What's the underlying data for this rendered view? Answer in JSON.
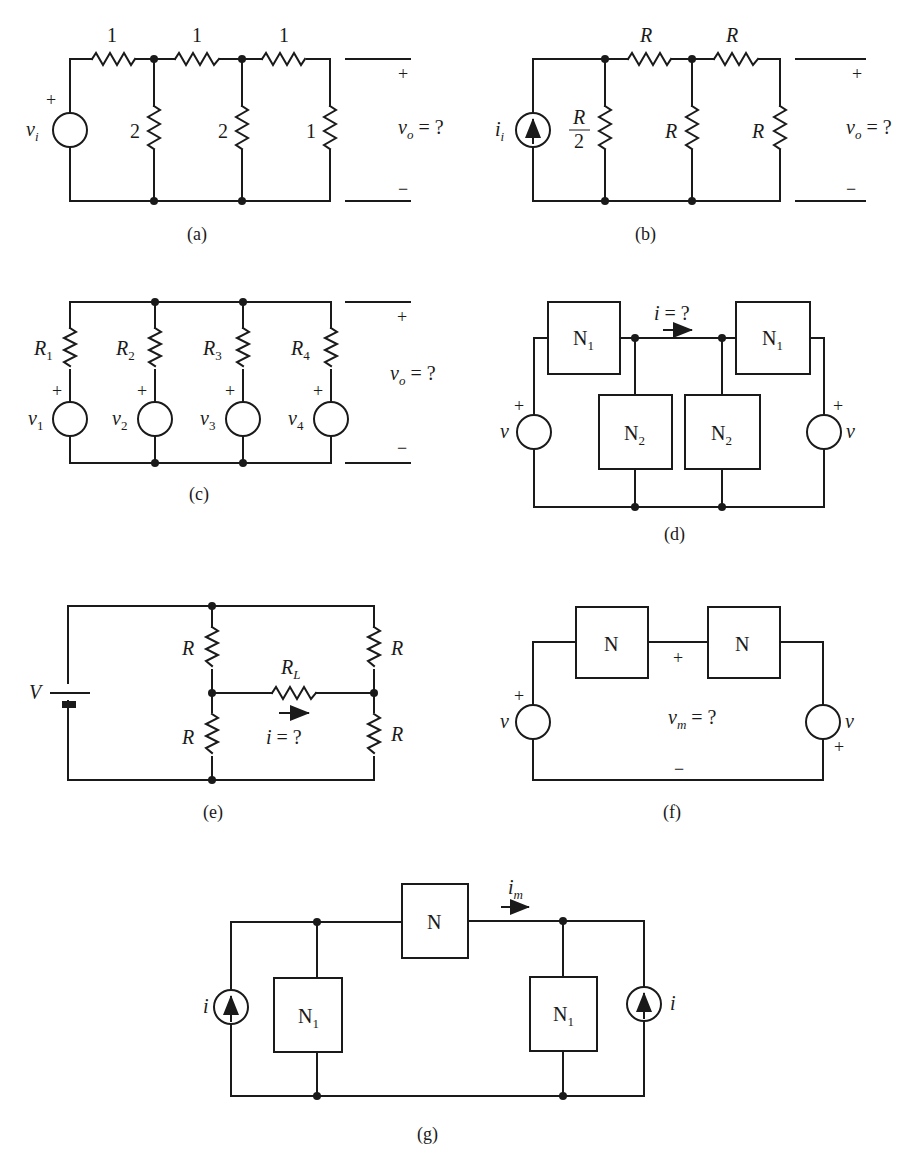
{
  "figure": {
    "panels": [
      {
        "id": "a",
        "caption": "(a)",
        "series_resistors": [
          "1",
          "1",
          "1"
        ],
        "shunt_resistors": [
          "2",
          "2",
          "1"
        ],
        "source": {
          "type": "voltage",
          "label": "v",
          "sub": "i",
          "polarity": "+"
        },
        "output": {
          "label": "v",
          "sub": "o",
          "expr": " = ?",
          "plus": "+",
          "minus": "−"
        }
      },
      {
        "id": "b",
        "caption": "(b)",
        "series_resistors": [
          "R",
          "R"
        ],
        "shunt_resistors": [
          {
            "label": "R",
            "denominator": "2"
          },
          {
            "label": "R"
          },
          {
            "label": "R"
          }
        ],
        "source": {
          "type": "current",
          "label": "i",
          "sub": "i"
        },
        "output": {
          "label": "v",
          "sub": "o",
          "expr": " = ?",
          "plus": "+",
          "minus": "−"
        }
      },
      {
        "id": "c",
        "caption": "(c)",
        "branches": [
          {
            "resistor": "R",
            "resistor_sub": "1",
            "source": "v",
            "source_sub": "1",
            "polarity": "+"
          },
          {
            "resistor": "R",
            "resistor_sub": "2",
            "source": "v",
            "source_sub": "2",
            "polarity": "+"
          },
          {
            "resistor": "R",
            "resistor_sub": "3",
            "source": "v",
            "source_sub": "3",
            "polarity": "+"
          },
          {
            "resistor": "R",
            "resistor_sub": "4",
            "source": "v",
            "source_sub": "4",
            "polarity": "+"
          }
        ],
        "output": {
          "label": "v",
          "sub": "o",
          "expr": " = ?",
          "plus": "+",
          "minus": "−"
        }
      },
      {
        "id": "d",
        "caption": "(d)",
        "blocks": [
          {
            "label": "N",
            "sub": "1"
          },
          {
            "label": "N",
            "sub": "1"
          },
          {
            "label": "N",
            "sub": "2"
          },
          {
            "label": "N",
            "sub": "2"
          }
        ],
        "sources": [
          {
            "label": "v",
            "polarity": "+"
          },
          {
            "label": "v",
            "polarity": "+"
          }
        ],
        "unknown": {
          "label": "i",
          "expr": " = ?"
        }
      },
      {
        "id": "e",
        "caption": "(e)",
        "battery": "V",
        "resistors": [
          "R",
          "R",
          "R",
          "R"
        ],
        "load": {
          "label": "R",
          "sub": "L"
        },
        "unknown": {
          "label": "i",
          "expr": " = ?"
        }
      },
      {
        "id": "f",
        "caption": "(f)",
        "blocks": [
          {
            "label": "N"
          },
          {
            "label": "N"
          }
        ],
        "sources": [
          {
            "label": "v",
            "polarity": "+"
          },
          {
            "label": "v",
            "polarity": "+"
          }
        ],
        "unknown": {
          "label": "v",
          "sub": "m",
          "expr": " = ?",
          "plus": "+",
          "minus": "−"
        }
      },
      {
        "id": "g",
        "caption": "(g)",
        "blocks": [
          {
            "label": "N"
          },
          {
            "label": "N",
            "sub": "1"
          },
          {
            "label": "N",
            "sub": "1"
          }
        ],
        "sources": [
          {
            "label": "i"
          },
          {
            "label": "i"
          }
        ],
        "unknown": {
          "label": "i",
          "sub": "m"
        }
      }
    ]
  }
}
